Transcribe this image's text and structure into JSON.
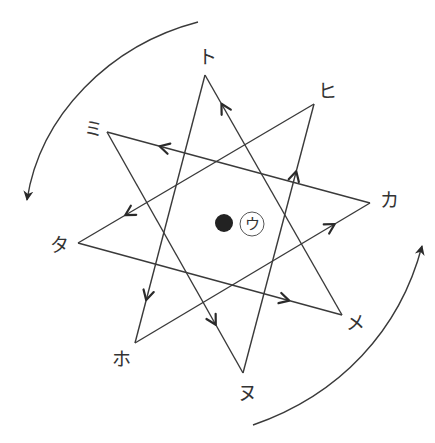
{
  "diagram": {
    "type": "eight-pointed star path with rotation arrows",
    "colors": {
      "line": "#3a3a3a",
      "background": "#ffffff",
      "dot": "#222222"
    },
    "vertices": [
      {
        "id": "to",
        "label": "ト"
      },
      {
        "id": "hi",
        "label": "ヒ"
      },
      {
        "id": "ka",
        "label": "カ"
      },
      {
        "id": "me",
        "label": "メ"
      },
      {
        "id": "nu",
        "label": "ヌ"
      },
      {
        "id": "ho",
        "label": "ホ"
      },
      {
        "id": "ta",
        "label": "タ"
      },
      {
        "id": "mi",
        "label": "ミ"
      }
    ],
    "path_order": [
      "ka",
      "mi",
      "nu",
      "hi",
      "ta",
      "me",
      "to",
      "ho",
      "ka"
    ],
    "edges": [
      {
        "from": "ka",
        "to": "mi"
      },
      {
        "from": "mi",
        "to": "nu"
      },
      {
        "from": "nu",
        "to": "hi"
      },
      {
        "from": "hi",
        "to": "ta"
      },
      {
        "from": "ta",
        "to": "me"
      },
      {
        "from": "me",
        "to": "to"
      },
      {
        "from": "to",
        "to": "ho"
      },
      {
        "from": "ho",
        "to": "ka"
      }
    ],
    "center": {
      "dot": "filled-dot",
      "label": "ウ"
    },
    "rotation_arrows": [
      {
        "name": "upper-left-arc",
        "direction": "counterclockwise"
      },
      {
        "name": "lower-right-arc",
        "direction": "counterclockwise"
      }
    ]
  }
}
